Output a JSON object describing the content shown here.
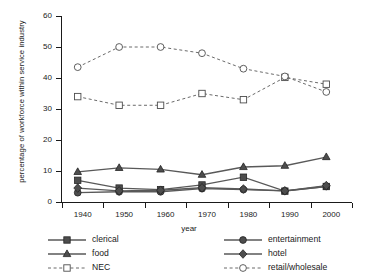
{
  "chart_data": {
    "type": "line",
    "title": "",
    "xlabel": "year",
    "ylabel": "percentage of workforce within service industry",
    "x": [
      1940,
      1950,
      1960,
      1970,
      1980,
      1990,
      2000
    ],
    "categories": [
      "1940",
      "1950",
      "1960",
      "1970",
      "1980",
      "1990",
      "2000"
    ],
    "xlim": [
      1935,
      2005
    ],
    "ylim": [
      0,
      60
    ],
    "yticks": [
      0,
      10,
      20,
      30,
      40,
      50,
      60
    ],
    "xticks": [
      "1940",
      "1950",
      "1960",
      "1970",
      "1980",
      "1990",
      "2000"
    ],
    "grid": false,
    "legend_position": "below-plot",
    "series": [
      {
        "name": "clerical",
        "marker": "filled-square",
        "line": "solid",
        "color": "#595959",
        "values": [
          7.0,
          4.5,
          4.0,
          5.5,
          8.0,
          3.5,
          5.0
        ]
      },
      {
        "name": "food",
        "marker": "filled-triangle",
        "line": "solid",
        "color": "#595959",
        "values": [
          9.7,
          11.0,
          10.5,
          8.8,
          11.3,
          11.7,
          14.5
        ]
      },
      {
        "name": "NEC",
        "marker": "open-square",
        "line": "dashed",
        "color": "#595959",
        "values": [
          34.0,
          31.2,
          31.2,
          35.0,
          33.0,
          40.2,
          38.0
        ]
      },
      {
        "name": "entertainment",
        "marker": "filled-circle",
        "line": "solid",
        "color": "#595959",
        "values": [
          3.0,
          3.3,
          3.3,
          4.3,
          4.0,
          3.6,
          5.0
        ]
      },
      {
        "name": "hotel",
        "marker": "filled-diamond",
        "line": "solid",
        "color": "#595959",
        "values": [
          4.5,
          3.6,
          3.8,
          4.6,
          4.2,
          3.6,
          5.3
        ]
      },
      {
        "name": "retail/wholesale",
        "marker": "open-circle",
        "line": "dashed",
        "color": "#595959",
        "values": [
          43.5,
          50.0,
          50.0,
          48.0,
          43.0,
          40.5,
          35.5
        ]
      }
    ]
  },
  "legend": {
    "columns": [
      [
        "clerical",
        "food",
        "NEC"
      ],
      [
        "entertainment",
        "hotel",
        "retail/wholesale"
      ]
    ]
  }
}
